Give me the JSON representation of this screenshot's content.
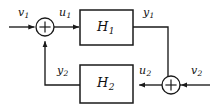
{
  "diagram": {
    "type": "feedback-block-diagram",
    "colors": {
      "line": "#1a1a1a",
      "text": "#111111",
      "background": "#ffffff"
    },
    "blocks": [
      {
        "id": "H1",
        "label": "H",
        "subscript": "1",
        "x": 80,
        "y": 10,
        "width": 53,
        "height": 35
      },
      {
        "id": "H2",
        "label": "H",
        "subscript": "2",
        "x": 80,
        "y": 65,
        "width": 53,
        "height": 38
      }
    ],
    "junctions": [
      {
        "id": "sum-left",
        "symbol": "+",
        "cx": 45,
        "cy": 27,
        "r": 9
      },
      {
        "id": "sum-right",
        "symbol": "+",
        "cx": 171,
        "cy": 85,
        "r": 9
      }
    ],
    "signals": [
      {
        "id": "v1",
        "label": "v",
        "subscript": "1",
        "role": "external-input-top",
        "x": 18,
        "y": 7
      },
      {
        "id": "u1",
        "label": "u",
        "subscript": "1",
        "role": "input-to-H1",
        "x": 59,
        "y": 7
      },
      {
        "id": "y1",
        "label": "y",
        "subscript": "1",
        "role": "output-of-H1",
        "x": 143,
        "y": 7
      },
      {
        "id": "y2",
        "label": "y",
        "subscript": "2",
        "role": "output-of-H2",
        "x": 57,
        "y": 65
      },
      {
        "id": "u2",
        "label": "u",
        "subscript": "2",
        "role": "input-to-H2",
        "x": 139,
        "y": 65
      },
      {
        "id": "v2",
        "label": "v",
        "subscript": "2",
        "role": "external-input-bottom",
        "x": 191,
        "y": 65
      }
    ],
    "edges": [
      {
        "from": "v1",
        "to": "sum-left",
        "direction": "right"
      },
      {
        "from": "sum-left",
        "to": "H1",
        "direction": "right"
      },
      {
        "from": "H1",
        "to": "sum-right",
        "direction": "down-right-path"
      },
      {
        "from": "v2",
        "to": "sum-right",
        "direction": "left"
      },
      {
        "from": "sum-right",
        "to": "H2",
        "direction": "left"
      },
      {
        "from": "H2",
        "to": "sum-left",
        "direction": "left-up-path"
      }
    ]
  }
}
